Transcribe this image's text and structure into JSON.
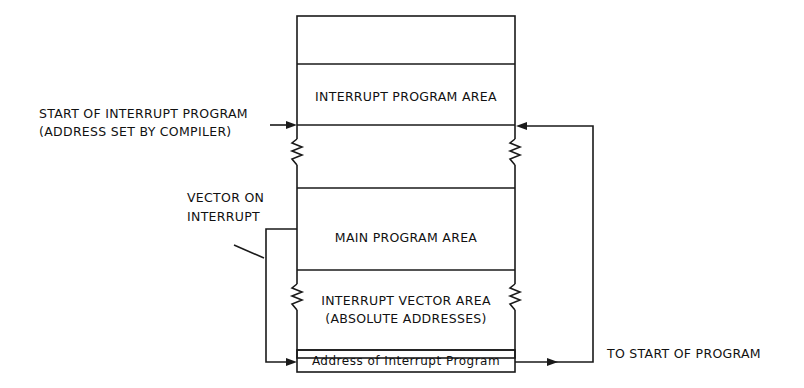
{
  "diagram": {
    "type": "memory-map",
    "line_color": "#1a1a1a",
    "memory_blocks": [
      {
        "id": "top",
        "label": ""
      },
      {
        "id": "interrupt-program-area",
        "label": "INTERRUPT PROGRAM AREA"
      },
      {
        "id": "gap",
        "label": ""
      },
      {
        "id": "main-program-area",
        "label": "MAIN PROGRAM AREA"
      },
      {
        "id": "interrupt-vector-area",
        "label_line1": "INTERRUPT VECTOR AREA",
        "label_line2": "(ABSOLUTE ADDRESSES)"
      },
      {
        "id": "address-cell",
        "label": "Address of Interrupt Program"
      }
    ],
    "annotations": {
      "start_interrupt_line1": "START OF INTERRUPT PROGRAM",
      "start_interrupt_line2": "(ADDRESS SET BY COMPILER)",
      "vector_line1": "VECTOR ON",
      "vector_line2": "INTERRUPT",
      "to_start": "TO START OF PROGRAM"
    }
  }
}
